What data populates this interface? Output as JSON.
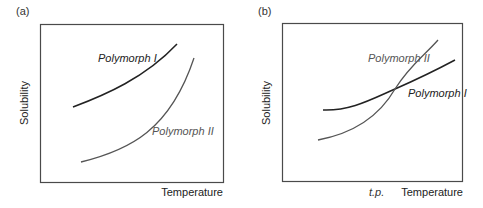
{
  "panels": [
    {
      "id": "a",
      "label": "(a)",
      "xlabel": "Temperature",
      "ylabel": "Solubility",
      "curves": [
        {
          "name": "Polymorph I",
          "color": "#222222",
          "description": "higher solubility at all temperatures"
        },
        {
          "name": "Polymorph II",
          "color": "#555555",
          "description": "lower solubility, steeper rise"
        }
      ]
    },
    {
      "id": "b",
      "label": "(b)",
      "xlabel": "Temperature",
      "ylabel": "Solubility",
      "xtick": "t.p.",
      "curves": [
        {
          "name": "Polymorph II",
          "color": "#555555",
          "description": "steeper curve, crosses Polymorph I at transition point"
        },
        {
          "name": "Polymorph I",
          "color": "#222222",
          "description": "flatter curve"
        }
      ],
      "annotation": "curves cross at transition point (t.p.)"
    }
  ],
  "colors": {
    "frame": "#4a4a4a",
    "curve_dark": "#222222",
    "curve_gray": "#555555"
  }
}
